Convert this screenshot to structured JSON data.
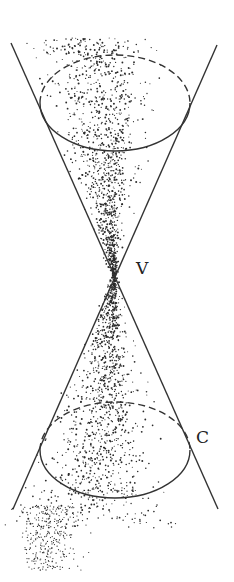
{
  "diagram": {
    "type": "double-cone",
    "labels": {
      "vertex": "V",
      "curve": "C"
    },
    "colors": {
      "line": "#333333",
      "stipple": "#2a2a2a",
      "background": "#ffffff"
    },
    "geometry": {
      "vertex": [
        115,
        276
      ],
      "generator_left": [
        [
          11,
          43
        ],
        [
          218,
          509
        ]
      ],
      "generator_right": [
        [
          217,
          45
        ],
        [
          13,
          509
        ]
      ],
      "top_ellipse": {
        "cx": 115,
        "cy": 103,
        "rx": 75,
        "ry": 48
      },
      "bottom_ellipse": {
        "cx": 115,
        "cy": 450,
        "rx": 75,
        "ry": 48
      },
      "vertex_label_pos": [
        136,
        274
      ],
      "curve_label_pos": [
        196,
        443
      ]
    }
  }
}
